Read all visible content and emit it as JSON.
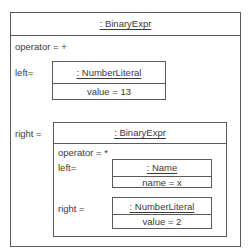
{
  "diagram": {
    "type": "uml-object-diagram",
    "root": {
      "title": ": BinaryExpr",
      "operator_label": "operator = +",
      "left_label": "left=",
      "right_label": "right =",
      "left": {
        "title": ": NumberLiteral",
        "attribute": "value = 13"
      },
      "right": {
        "title": ": BinaryExpr",
        "operator_label": "operator = *",
        "left_label": "left=",
        "right_label": "right =",
        "left": {
          "title": ": Name",
          "attribute": "name = x"
        },
        "right": {
          "title": ": NumberLiteral",
          "attribute": "value = 2"
        }
      }
    },
    "colors": {
      "border": "#5a5a5a",
      "text": "#3a3a3a",
      "background": "#ffffff"
    }
  }
}
